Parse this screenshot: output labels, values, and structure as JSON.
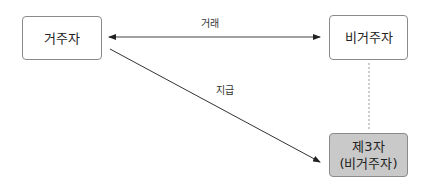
{
  "nodes": {
    "resident": {
      "label": "거주자"
    },
    "nonresident": {
      "label": "비거주자"
    },
    "third_party": {
      "line1": "제3자",
      "line2": "(비거주자)",
      "fill": "#c9c9c9"
    }
  },
  "edges": {
    "transaction": {
      "label": "거래",
      "from": "resident",
      "to": "nonresident",
      "style": "solid",
      "direction": "both"
    },
    "payment": {
      "label": "지급",
      "from": "resident",
      "to": "third_party",
      "style": "solid",
      "direction": "forward"
    },
    "relation": {
      "from": "nonresident",
      "to": "third_party",
      "style": "dashed"
    }
  }
}
